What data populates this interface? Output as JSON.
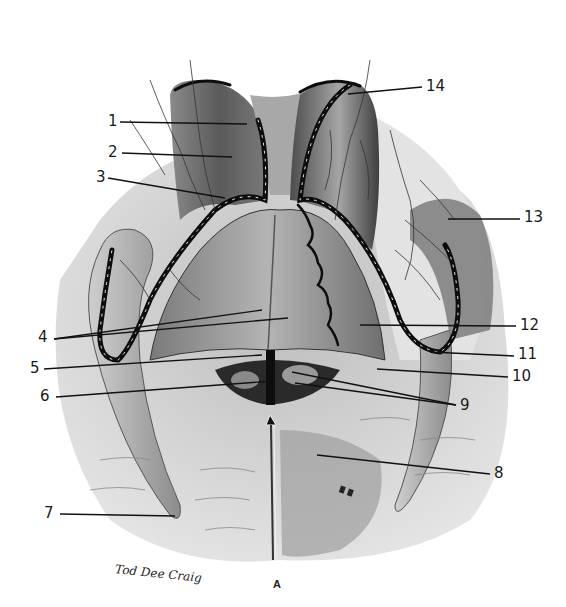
{
  "figure": {
    "caption": "A",
    "signature": "Tod Dee Craig",
    "colors": {
      "background": "#ffffff",
      "tissue_light": "#d9d9d9",
      "tissue_mid": "#9a9a9a",
      "tissue_dark": "#4a4a4a",
      "vessel": "#0d0d0d",
      "leader_line": "#111111",
      "leader_highlight": "#f2f2f2"
    },
    "labels": [
      {
        "id": "1",
        "text": "1",
        "x": 108,
        "y": 114,
        "tip": [
          [
            247,
            124
          ]
        ]
      },
      {
        "id": "2",
        "text": "2",
        "x": 108,
        "y": 145,
        "tip": [
          [
            232,
            157
          ]
        ]
      },
      {
        "id": "3",
        "text": "3",
        "x": 96,
        "y": 170,
        "tip": [
          [
            225,
            198
          ]
        ]
      },
      {
        "id": "4",
        "text": "4",
        "x": 38,
        "y": 330,
        "tip": [
          [
            262,
            310
          ],
          [
            288,
            318
          ]
        ]
      },
      {
        "id": "5",
        "text": "5",
        "x": 30,
        "y": 361,
        "tip": [
          [
            262,
            355
          ]
        ]
      },
      {
        "id": "6",
        "text": "6",
        "x": 40,
        "y": 389,
        "tip": [
          [
            272,
            381
          ]
        ]
      },
      {
        "id": "7",
        "text": "7",
        "x": 44,
        "y": 506,
        "tip": [
          [
            175,
            516
          ]
        ]
      },
      {
        "id": "8",
        "text": "8",
        "x": 494,
        "y": 466,
        "tip": [
          [
            317,
            455
          ]
        ]
      },
      {
        "id": "9",
        "text": "9",
        "x": 460,
        "y": 398,
        "tip": [
          [
            292,
            372
          ],
          [
            295,
            383
          ]
        ]
      },
      {
        "id": "10",
        "text": "10",
        "x": 512,
        "y": 369,
        "tip": [
          [
            377,
            369
          ]
        ]
      },
      {
        "id": "11",
        "text": "11",
        "x": 518,
        "y": 347,
        "tip": [
          [
            430,
            352
          ]
        ]
      },
      {
        "id": "12",
        "text": "12",
        "x": 520,
        "y": 318,
        "tip": [
          [
            360,
            325
          ]
        ]
      },
      {
        "id": "13",
        "text": "13",
        "x": 524,
        "y": 210,
        "tip": [
          [
            448,
            219
          ]
        ]
      },
      {
        "id": "14",
        "text": "14",
        "x": 426,
        "y": 79,
        "tip": [
          [
            348,
            94
          ]
        ]
      }
    ]
  }
}
